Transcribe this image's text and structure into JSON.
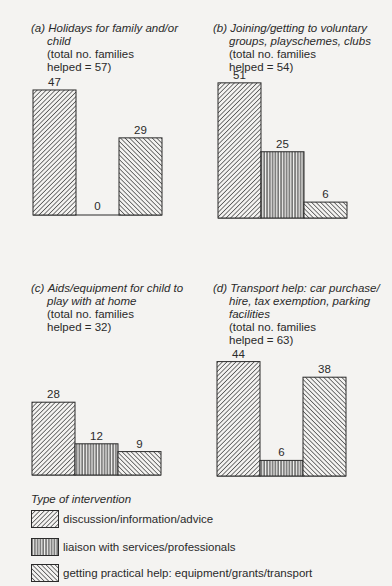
{
  "panels": [
    {
      "letter": "(a)",
      "subject_line1": "Holidays for family and/or",
      "subject_line2": "child",
      "total_line1": "(total no. families",
      "total_line2": "helped = 57)"
    },
    {
      "letter": "(b)",
      "subject_line1": "Joining/getting to voluntary",
      "subject_line2": "groups, playschemes, clubs",
      "total_line1": "(total no. families",
      "total_line2": "helped = 54)"
    },
    {
      "letter": "(c)",
      "subject_line1": "Aids/equipment for child to",
      "subject_line2": "play with at home",
      "total_line1": "(total no. families",
      "total_line2": "helped = 32)"
    },
    {
      "letter": "(d)",
      "subject_line1": "Transport help: car purchase/",
      "subject_line2": "hire, tax exemption, parking",
      "subject_line3": "facilities",
      "total_line1": "(total no. families",
      "total_line2": "helped = 63)"
    }
  ],
  "legend": {
    "title": "Type of intervention",
    "items": [
      {
        "label": "discussion/information/advice",
        "pattern": "diagonal-forward"
      },
      {
        "label": "liaison with services/professionals",
        "pattern": "vertical"
      },
      {
        "label": "getting practical help: equipment/grants/transport",
        "pattern": "diagonal-back"
      }
    ]
  },
  "chart_data": [
    {
      "type": "bar",
      "title": "(a) Holidays for family and/or child (total no. families helped = 57)",
      "categories": [
        "discussion/information/advice",
        "liaison with services/professionals",
        "getting practical help: equipment/grants/transport"
      ],
      "values": [
        47,
        0,
        29
      ],
      "labels": [
        "47",
        "0",
        "29"
      ]
    },
    {
      "type": "bar",
      "title": "(b) Joining/getting to voluntary groups, playschemes, clubs (total no. families helped = 54)",
      "categories": [
        "discussion/information/advice",
        "liaison with services/professionals",
        "getting practical help: equipment/grants/transport"
      ],
      "values": [
        51,
        25,
        6
      ],
      "labels": [
        "51",
        "25",
        "6"
      ]
    },
    {
      "type": "bar",
      "title": "(c) Aids/equipment for child to play with at home (total no. families helped = 32)",
      "categories": [
        "discussion/information/advice",
        "liaison with services/professionals",
        "getting practical help: equipment/grants/transport"
      ],
      "values": [
        28,
        12,
        9
      ],
      "labels": [
        "28",
        "12",
        "9"
      ]
    },
    {
      "type": "bar",
      "title": "(d) Transport help: car purchase/hire, tax exemption, parking facilities (total no. families helped = 63)",
      "categories": [
        "discussion/information/advice",
        "liaison with services/professionals",
        "getting practical help: equipment/grants/transport"
      ],
      "values": [
        44,
        6,
        38
      ],
      "labels": [
        "44",
        "6",
        "38"
      ]
    }
  ]
}
